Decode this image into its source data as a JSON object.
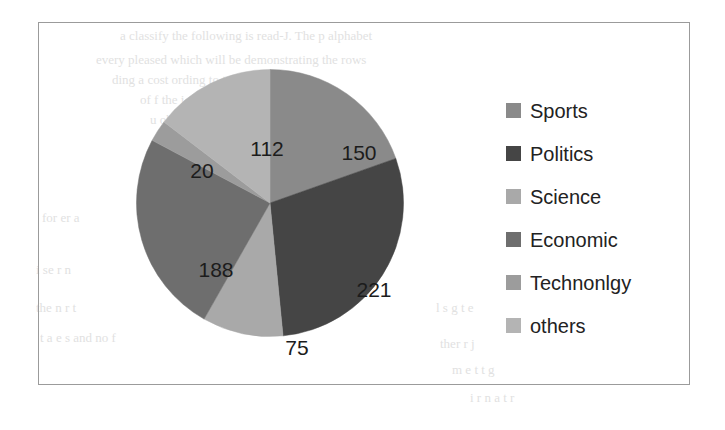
{
  "chart_data": {
    "type": "pie",
    "title": "",
    "subtitle": "",
    "xlabel": "",
    "ylabel": "",
    "grid": false,
    "legend_position": "right",
    "total": 766,
    "categories": [
      "Sports",
      "Politics",
      "Science",
      "Economic",
      "Technonlgy",
      "others"
    ],
    "values": [
      150,
      221,
      75,
      188,
      20,
      112
    ],
    "slices": [
      {
        "label": "Sports",
        "value": 150,
        "value_text": "150",
        "color": "#8a8a8a",
        "start_angle": 0,
        "sweep_angle": 70.5,
        "label_x": 320,
        "label_y": 130
      },
      {
        "label": "Politics",
        "value": 221,
        "value_text": "221",
        "color": "#454545",
        "start_angle": 70.5,
        "sweep_angle": 103.9,
        "label_x": 335,
        "label_y": 267
      },
      {
        "label": "Science",
        "value": 75,
        "value_text": "75",
        "color": "#a9a9a9",
        "start_angle": 174.4,
        "sweep_angle": 35.2,
        "label_x": 258,
        "label_y": 325
      },
      {
        "label": "Economic",
        "value": 188,
        "value_text": "188",
        "color": "#6e6e6e",
        "start_angle": 209.6,
        "sweep_angle": 88.4,
        "label_x": 177,
        "label_y": 247
      },
      {
        "label": "Technonlgy",
        "value": 20,
        "value_text": "20",
        "color": "#9c9c9c",
        "start_angle": 298.0,
        "sweep_angle": 9.4,
        "label_x": 163,
        "label_y": 148
      },
      {
        "label": "others",
        "value": 112,
        "value_text": "112",
        "color": "#b4b4b4",
        "start_angle": 307.4,
        "sweep_angle": 52.6,
        "label_x": 228,
        "label_y": 126
      }
    ],
    "legend": [
      {
        "label": "Sports",
        "color": "#8a8a8a"
      },
      {
        "label": "Politics",
        "color": "#454545"
      },
      {
        "label": "Science",
        "color": "#a9a9a9"
      },
      {
        "label": "Economic",
        "color": "#6e6e6e"
      },
      {
        "label": "Technonlgy",
        "color": "#9c9c9c"
      },
      {
        "label": "others",
        "color": "#b4b4b4"
      }
    ]
  },
  "frame": {
    "border_color": "#9b9b9b",
    "background": "#ffffff"
  },
  "background_text": {
    "lines": [
      {
        "text": "a classify the following is read-J. The p   alphabet",
        "x": 120,
        "y": 28,
        "size": 13
      },
      {
        "text": "every pleased which will be demonstrating the rows",
        "x": 96,
        "y": 52,
        "size": 13
      },
      {
        "text": "ding  a  cost  ording to terms of   - t  a  and",
        "x": 112,
        "y": 72,
        "size": 13
      },
      {
        "text": "of  f   the   i  a   ove  to   l    segment and to",
        "x": 140,
        "y": 92,
        "size": 13
      },
      {
        "text": "u    observations   l t in",
        "x": 150,
        "y": 112,
        "size": 13
      },
      {
        "text": "for  er  a",
        "x": 42,
        "y": 210,
        "size": 13
      },
      {
        "text": "i   se  r    n",
        "x": 36,
        "y": 262,
        "size": 13
      },
      {
        "text": "the     n    r   t",
        "x": 36,
        "y": 300,
        "size": 13
      },
      {
        "text": "t   a  e  s  and no   f",
        "x": 40,
        "y": 330,
        "size": 13
      },
      {
        "text": "l   s  g  t    e",
        "x": 436,
        "y": 300,
        "size": 13
      },
      {
        "text": "ther    r    j",
        "x": 440,
        "y": 336,
        "size": 13
      },
      {
        "text": "m   e   t  t     g",
        "x": 452,
        "y": 362,
        "size": 13
      },
      {
        "text": "i  r    n  a  t   r",
        "x": 470,
        "y": 390,
        "size": 13
      }
    ]
  }
}
